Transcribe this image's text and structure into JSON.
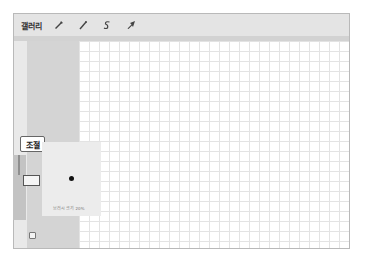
{
  "toolbar": {
    "gallery_label": "갤러리",
    "tools": [
      {
        "name": "wrench-icon",
        "label": "actions"
      },
      {
        "name": "magic-wand-icon",
        "label": "adjustments"
      },
      {
        "name": "selection-s-icon",
        "label": "selection"
      },
      {
        "name": "arrow-cursor-icon",
        "label": "transform"
      }
    ]
  },
  "sidebar": {
    "popup_label": "조절",
    "preview_caption": "브러시 크기 20%"
  },
  "colors": {
    "toolbar_bg": "#e4e4e4",
    "sidebar_bg": "#d4d4d4",
    "grid_line": "#e3e3e3",
    "brush_dot": "#111111"
  }
}
